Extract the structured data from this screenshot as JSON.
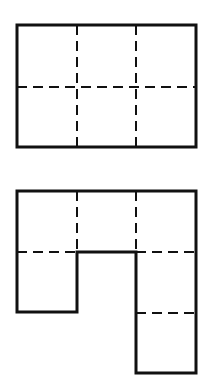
{
  "figures": [
    {
      "name": "rectangle-net",
      "description": "3x2 grid rectangle with dashed fold lines",
      "outer": {
        "x1": 17,
        "y1": 25,
        "x2": 196,
        "y2": 147
      },
      "dashed_vertical_x": [
        77,
        136
      ],
      "dashed_horizontal_y": [
        87
      ]
    },
    {
      "name": "irregular-net",
      "description": "Net shape with top row of three squares, one square below left, two squares below right",
      "top_y": 191,
      "mid_y": 252,
      "left_bottom_y": 312,
      "right_mid_y": 313,
      "right_bottom_y": 373,
      "cols_x": [
        17,
        77,
        136,
        196
      ]
    }
  ],
  "colors": {
    "stroke": "#111111",
    "background": "#ffffff"
  }
}
